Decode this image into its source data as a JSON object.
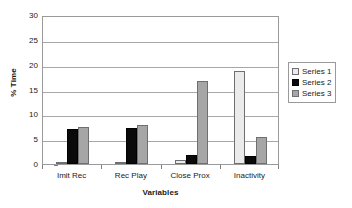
{
  "chart_data": {
    "type": "bar",
    "title": "",
    "subtitle": "",
    "xlabel": "Variables",
    "ylabel": "% Time",
    "categories": [
      "Imit Rec",
      "Rec Play",
      "Close Prox",
      "Inactivity"
    ],
    "series": [
      {
        "name": "Series 1",
        "color": "#ebebeb",
        "values": [
          0.5,
          0.4,
          0.9,
          18.7
        ]
      },
      {
        "name": "Series 2",
        "color": "#0a0a0a",
        "values": [
          7.0,
          7.3,
          1.8,
          1.7
        ]
      },
      {
        "name": "Series 3",
        "color": "#a6a6a6",
        "values": [
          7.5,
          7.9,
          16.8,
          5.4
        ]
      }
    ],
    "ylim": [
      0,
      30
    ],
    "ytick_step": 5,
    "yticks": [
      0,
      5,
      10,
      15,
      20,
      25,
      30
    ],
    "ytick_labels": [
      "0",
      "5",
      "10",
      "15",
      "20",
      "25",
      "30"
    ],
    "grid": true,
    "grid_axis": "y",
    "legend_position": "right",
    "annotations": []
  },
  "colors": {
    "series_1": "#ebebeb",
    "series_2": "#0a0a0a",
    "series_3": "#a6a6a6",
    "axis": "#9a9a9a",
    "gridline": "#a8a8a8",
    "text": "#1a1a1a",
    "background": "#ffffff"
  }
}
